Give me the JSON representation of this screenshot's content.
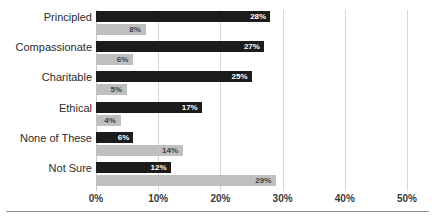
{
  "chart_data": {
    "type": "bar",
    "orientation": "horizontal",
    "title": "",
    "xlabel": "",
    "ylabel": "",
    "categories": [
      "Principled",
      "Compassionate",
      "Charitable",
      "Ethical",
      "None of These",
      "Not Sure"
    ],
    "series": [
      {
        "name": "Series 1",
        "color": "#1c1c1c",
        "values": [
          28,
          27,
          25,
          17,
          6,
          12
        ],
        "labels": [
          "28%",
          "27%",
          "25%",
          "17%",
          "6%",
          "12%"
        ]
      },
      {
        "name": "Series 2",
        "color": "#bfbfbf",
        "values": [
          8,
          6,
          5,
          4,
          14,
          29
        ],
        "labels": [
          "8%",
          "6%",
          "5%",
          "4%",
          "14%",
          "29%"
        ]
      }
    ],
    "xlim": [
      0,
      50
    ],
    "xticks": [
      0,
      10,
      20,
      30,
      40,
      50
    ],
    "xtick_labels": [
      "0%",
      "10%",
      "20%",
      "30%",
      "40%",
      "50%"
    ],
    "grid": true,
    "grid_axis": "x",
    "legend": "none"
  },
  "axis": {
    "tick_labels": [
      "0%",
      "10%",
      "20%",
      "30%",
      "40%",
      "50%"
    ]
  },
  "title_strip": {
    "text": ""
  }
}
